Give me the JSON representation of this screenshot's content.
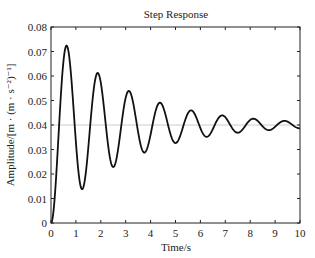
{
  "chart_data": {
    "type": "line",
    "title": "Step Response",
    "xlabel": "Time/s",
    "ylabel": "Amplitude/[m · (m · s⁻²)⁻¹]",
    "xlim": [
      0,
      10
    ],
    "ylim": [
      0,
      0.08
    ],
    "xticks": [
      0,
      1,
      2,
      3,
      4,
      5,
      6,
      7,
      8,
      9,
      10
    ],
    "yticks": [
      0,
      0.01,
      0.02,
      0.03,
      0.04,
      0.05,
      0.06,
      0.07,
      0.08
    ],
    "ytick_labels": [
      "0",
      "0.01",
      "0.02",
      "0.03",
      "0.04",
      "0.05",
      "0.06",
      "0.07",
      "0.08"
    ],
    "grid": false,
    "legend": null,
    "reference_line": {
      "y": 0.04,
      "color": "#cccccc",
      "label": "steady state"
    },
    "series": [
      {
        "name": "step response",
        "color": "#111111",
        "x": [
          0,
          0.25,
          0.57,
          0.9,
          1.25,
          1.55,
          1.85,
          2.15,
          2.45,
          2.8,
          3.1,
          3.4,
          3.73,
          4.05,
          4.34,
          4.65,
          4.94,
          5.3,
          5.6,
          5.9,
          6.2,
          6.5,
          6.83,
          7.13,
          7.43,
          7.75,
          8.07,
          8.4,
          8.71,
          9.0,
          9.32,
          9.65,
          10.0
        ],
        "values": [
          0,
          0.0405,
          0.0718,
          0.0455,
          0.0139,
          0.039,
          0.0608,
          0.042,
          0.0233,
          0.0395,
          0.0535,
          0.041,
          0.029,
          0.0398,
          0.0486,
          0.0405,
          0.0335,
          0.04,
          0.0457,
          0.0402,
          0.0347,
          0.04,
          0.0441,
          0.0401,
          0.0363,
          0.04,
          0.0429,
          0.0401,
          0.0376,
          0.04,
          0.042,
          0.0405,
          0.0388
        ]
      }
    ],
    "peaks": [
      {
        "t": 0.57,
        "amp": 0.0718
      },
      {
        "t": 1.85,
        "amp": 0.0608
      },
      {
        "t": 3.1,
        "amp": 0.0535
      },
      {
        "t": 4.34,
        "amp": 0.0486
      },
      {
        "t": 5.6,
        "amp": 0.0457
      },
      {
        "t": 6.83,
        "amp": 0.0441
      },
      {
        "t": 8.07,
        "amp": 0.0429
      },
      {
        "t": 9.32,
        "amp": 0.042
      }
    ],
    "valleys": [
      {
        "t": 1.25,
        "amp": 0.0139
      },
      {
        "t": 2.45,
        "amp": 0.0233
      },
      {
        "t": 3.73,
        "amp": 0.029
      },
      {
        "t": 4.94,
        "amp": 0.0335
      },
      {
        "t": 6.2,
        "amp": 0.0347
      },
      {
        "t": 7.43,
        "amp": 0.0363
      },
      {
        "t": 8.71,
        "amp": 0.0376
      }
    ]
  }
}
